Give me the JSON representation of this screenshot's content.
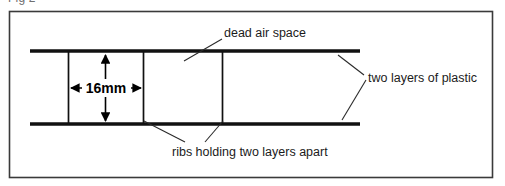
{
  "figure": {
    "clipped_caption": "Fig 2",
    "frame": {
      "border_color": "#3a3a3a"
    },
    "background_color": "#ffffff",
    "line_color": "#111111"
  },
  "labels": {
    "dead_air_space": "dead air space",
    "two_layers_of_plastic": "two layers of plastic",
    "ribs_holding_two_layers_apart": "ribs holding two layers apart",
    "dimension": "16mm"
  },
  "callouts": [
    {
      "name": "dead-air-space",
      "text": "dead air space",
      "anchor": "upper-sheet-gap"
    },
    {
      "name": "two-layers-of-plastic",
      "text": "two layers of plastic",
      "anchor": "upper-and-lower-sheets"
    },
    {
      "name": "ribs-holding-two-layers-apart",
      "text": "ribs holding two layers apart",
      "anchor": "vertical-ribs"
    }
  ],
  "dimension": {
    "value": "16mm",
    "horizontal_span": "between first and second rib",
    "vertical_span": "between upper and lower plastic sheet"
  },
  "structure": {
    "sheets": 2,
    "ribs": 3,
    "cavity_label": "dead air space"
  }
}
